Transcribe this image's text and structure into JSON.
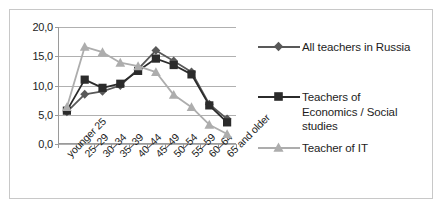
{
  "chart_data": {
    "type": "line",
    "title": "",
    "xlabel": "",
    "ylabel": "",
    "ylim": [
      0,
      20
    ],
    "ytick_step": 5,
    "grid": true,
    "legend_position": "right",
    "decimal_separator": ",",
    "categories": [
      "younger 25",
      "25–29",
      "30–34",
      "35–39",
      "40–44",
      "45–49",
      "50–54",
      "55–59",
      "60–64",
      "65 and older"
    ],
    "ytick_labels": [
      "0,0",
      "5,0",
      "10,0",
      "15,0",
      "20,0"
    ],
    "ytick_values": [
      0,
      5,
      10,
      15,
      20
    ],
    "series": [
      {
        "name": "All teachers in Russia",
        "marker": "diamond",
        "color": "#595959",
        "values": [
          5.5,
          8.5,
          9.0,
          10.0,
          12.8,
          16.0,
          14.2,
          12.3,
          6.8,
          4.3
        ]
      },
      {
        "name": "Teachers of Economics / Social studies",
        "legend_label": "Teachers of\nEconomics / Social\nstudies",
        "marker": "square",
        "color": "#2b2b2b",
        "values": [
          5.7,
          11.0,
          9.6,
          10.3,
          12.5,
          14.6,
          13.5,
          11.9,
          6.6,
          3.7
        ]
      },
      {
        "name": "Teacher of IT",
        "legend_label": "Teacher of IT",
        "marker": "triangle",
        "color": "#adadad",
        "values": [
          6.3,
          16.6,
          15.7,
          13.9,
          13.3,
          12.3,
          8.4,
          6.3,
          3.3,
          1.7
        ]
      }
    ]
  },
  "legend": {
    "items": [
      {
        "label": "All teachers in Russia"
      },
      {
        "label": "Teachers of\nEconomics / Social\nstudies"
      },
      {
        "label": "Teacher of IT"
      }
    ]
  },
  "colors": {
    "series_all_teachers": "#595959",
    "series_economics": "#2b2b2b",
    "series_it": "#adadad",
    "gridline": "#b0b0b0",
    "axis": "#9a9a9a",
    "frame_border": "#c8c8c8",
    "text": "#1d1d1d",
    "background": "#ffffff"
  }
}
